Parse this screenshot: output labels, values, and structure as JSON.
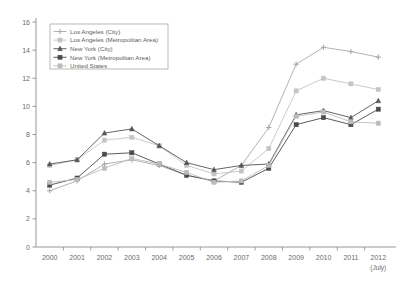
{
  "chart_data": {
    "type": "line",
    "title": "",
    "subtitle": "",
    "xlabel": "",
    "ylabel": "",
    "grid": false,
    "legend_position": "top-left",
    "x": [
      "2000",
      "2001",
      "2002",
      "2003",
      "2004",
      "2005",
      "2006",
      "2007",
      "2008",
      "2009",
      "2010",
      "2011",
      "2012"
    ],
    "x_tick_labels": [
      "2000",
      "2001",
      "2002",
      "2003",
      "2004",
      "2005",
      "2006",
      "2007",
      "2008",
      "2009",
      "2010",
      "2011",
      "2012"
    ],
    "x_last_sub_label": "(July)",
    "y_tick_labels": [
      "0",
      "2",
      "4",
      "6",
      "8",
      "10",
      "12",
      "14",
      "16"
    ],
    "y_ticks": [
      0,
      2,
      4,
      6,
      8,
      10,
      12,
      14,
      16
    ],
    "ylim": [
      0,
      16
    ],
    "series": [
      {
        "name": "Los Angeles (City)",
        "marker": "cross",
        "color": "#a9a9a9",
        "values": [
          4.0,
          4.7,
          5.9,
          6.2,
          5.8,
          5.1,
          4.7,
          5.8,
          8.5,
          13.0,
          14.2,
          13.9,
          13.5
        ]
      },
      {
        "name": "Los Angeles (Metropolitan Area)",
        "marker": "square",
        "color": "#c4c4c4",
        "values": [
          5.8,
          6.2,
          7.6,
          7.8,
          7.2,
          5.8,
          5.2,
          5.4,
          7.0,
          11.1,
          12.0,
          11.6,
          11.2
        ]
      },
      {
        "name": "New York (City)",
        "marker": "triangle",
        "color": "#555555",
        "values": [
          5.9,
          6.2,
          8.1,
          8.4,
          7.2,
          6.0,
          5.5,
          5.8,
          5.9,
          9.4,
          9.7,
          9.2,
          10.4
        ]
      },
      {
        "name": "New York (Metropolitan Area)",
        "marker": "square",
        "color": "#4a4a4a",
        "values": [
          4.4,
          4.9,
          6.6,
          6.7,
          5.9,
          5.1,
          4.7,
          4.6,
          5.6,
          8.7,
          9.2,
          8.7,
          9.8
        ]
      },
      {
        "name": "United States",
        "marker": "square",
        "color": "#bcbcbc",
        "values": [
          4.6,
          4.8,
          5.6,
          6.3,
          5.9,
          5.3,
          4.6,
          4.7,
          5.8,
          9.3,
          9.6,
          8.9,
          8.8
        ]
      }
    ]
  }
}
